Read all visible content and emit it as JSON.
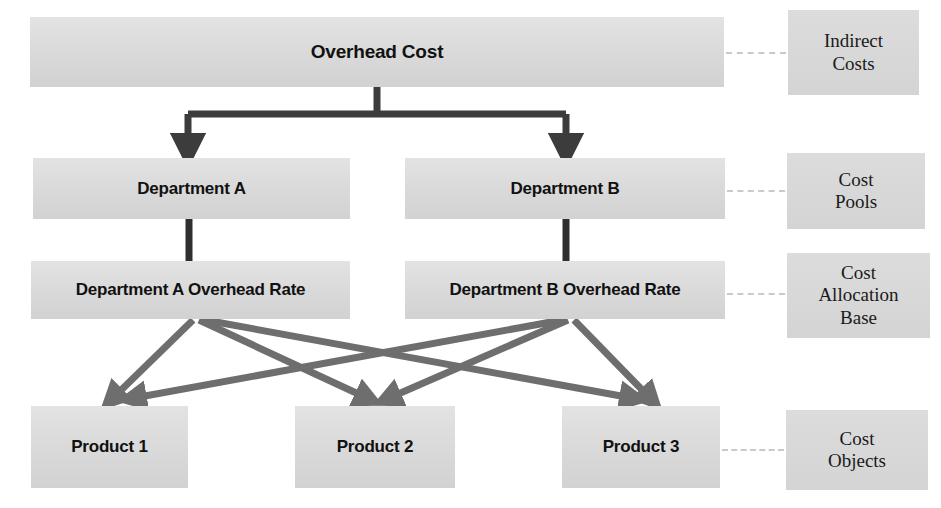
{
  "diagram": {
    "colors": {
      "box_fill": "#dedede",
      "legend_fill": "#d8d8d8",
      "primary_arrow": "#3c3c3c",
      "allocation_arrow": "#707070",
      "dashed_connector": "#c9c9c9",
      "text": "#111111",
      "background": "#ffffff"
    },
    "flow_nodes": [
      {
        "id": "overhead",
        "label": "Overhead Cost"
      },
      {
        "id": "dept_a",
        "label": "Department A"
      },
      {
        "id": "dept_b",
        "label": "Department B"
      },
      {
        "id": "rate_a",
        "label": "Department A Overhead Rate"
      },
      {
        "id": "rate_b",
        "label": "Department B Overhead Rate"
      },
      {
        "id": "product_1",
        "label": "Product 1"
      },
      {
        "id": "product_2",
        "label": "Product 2"
      },
      {
        "id": "product_3",
        "label": "Product 3"
      }
    ],
    "legend_nodes": [
      {
        "id": "indirect_costs",
        "line1": "Indirect",
        "line2": "Costs",
        "line3": ""
      },
      {
        "id": "cost_pools",
        "line1": "Cost",
        "line2": "Pools",
        "line3": ""
      },
      {
        "id": "cost_allocation_base",
        "line1": "Cost",
        "line2": "Allocation",
        "line3": "Base"
      },
      {
        "id": "cost_objects",
        "line1": "Cost",
        "line2": "Objects",
        "line3": ""
      }
    ],
    "connections": [
      {
        "from": "overhead",
        "to": "dept_a",
        "style": "solid-arrow"
      },
      {
        "from": "overhead",
        "to": "dept_b",
        "style": "solid-arrow"
      },
      {
        "from": "dept_a",
        "to": "rate_a",
        "style": "solid-line"
      },
      {
        "from": "dept_b",
        "to": "rate_b",
        "style": "solid-line"
      },
      {
        "from": "rate_a",
        "to": "product_1",
        "style": "allocation-arrow"
      },
      {
        "from": "rate_a",
        "to": "product_2",
        "style": "allocation-arrow"
      },
      {
        "from": "rate_a",
        "to": "product_3",
        "style": "allocation-arrow"
      },
      {
        "from": "rate_b",
        "to": "product_1",
        "style": "allocation-arrow"
      },
      {
        "from": "rate_b",
        "to": "product_2",
        "style": "allocation-arrow"
      },
      {
        "from": "rate_b",
        "to": "product_3",
        "style": "allocation-arrow"
      },
      {
        "from": "overhead",
        "to": "indirect_costs",
        "style": "dashed"
      },
      {
        "from": "dept_b",
        "to": "cost_pools",
        "style": "dashed"
      },
      {
        "from": "rate_b",
        "to": "cost_allocation_base",
        "style": "dashed"
      },
      {
        "from": "product_3",
        "to": "cost_objects",
        "style": "dashed"
      }
    ]
  }
}
